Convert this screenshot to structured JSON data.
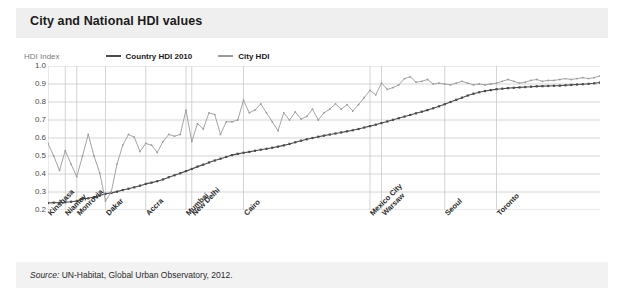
{
  "figure": {
    "title": "City and National HDI values",
    "source": "Source: UN-Habitat, Global Urban Observatory, 2012.",
    "source_prefix": "Source:",
    "source_body": " UN-Habitat, Global Urban Observatory, 2012."
  },
  "colors": {
    "country_line": "#4a4a4a",
    "city_line": "#9a9a9a",
    "grid": "#c9c9c9",
    "header_band": "#efefef",
    "source_band": "#f2f2f2",
    "title_text": "#1a1a1a",
    "axis_text": "#4a4a4a",
    "caption_text": "#7d7d7d"
  },
  "chart_data": {
    "type": "line",
    "title": "City and National HDI values",
    "subtitle": "",
    "xlabel": "",
    "ylabel": "HDI Index",
    "ylim": [
      0.2,
      1.0
    ],
    "yticks": [
      "1.0",
      "0.9",
      "0.8",
      "0.7",
      "0.6",
      "0.5",
      "0.4",
      "0.3",
      "0.2"
    ],
    "ytick_values": [
      1.0,
      0.9,
      0.8,
      0.7,
      0.6,
      0.5,
      0.4,
      0.3,
      0.2
    ],
    "grid": true,
    "grid_horizontal": true,
    "grid_vertical": true,
    "legend_position": "top-left",
    "legend": [
      "Country HDI 2010",
      "City HDI"
    ],
    "axis_caption": "HDI Index",
    "n_points": 97,
    "xtick_labels": [
      "Kinshasa",
      "Niamey",
      "Monrovia",
      "Dakar",
      "Accra",
      "Mumbai",
      "New Delhi",
      "Cairo",
      "Mexico City",
      "Warsaw",
      "Seoul",
      "Toronto"
    ],
    "xtick_indices": [
      0,
      3,
      5,
      10,
      17,
      24,
      25,
      34,
      56,
      58,
      69,
      78
    ],
    "series": [
      {
        "name": "Country HDI 2010",
        "color": "#4a4a4a",
        "marker": "square",
        "values": [
          0.239,
          0.241,
          0.24,
          0.243,
          0.246,
          0.25,
          0.262,
          0.265,
          0.272,
          0.28,
          0.29,
          0.295,
          0.302,
          0.311,
          0.318,
          0.326,
          0.335,
          0.345,
          0.352,
          0.36,
          0.37,
          0.382,
          0.393,
          0.404,
          0.416,
          0.428,
          0.441,
          0.452,
          0.464,
          0.475,
          0.485,
          0.495,
          0.505,
          0.512,
          0.518,
          0.523,
          0.529,
          0.535,
          0.54,
          0.546,
          0.552,
          0.559,
          0.567,
          0.576,
          0.585,
          0.593,
          0.6,
          0.607,
          0.613,
          0.619,
          0.625,
          0.631,
          0.637,
          0.643,
          0.65,
          0.658,
          0.666,
          0.674,
          0.683,
          0.692,
          0.701,
          0.71,
          0.719,
          0.728,
          0.737,
          0.746,
          0.755,
          0.765,
          0.776,
          0.788,
          0.8,
          0.812,
          0.824,
          0.836,
          0.846,
          0.854,
          0.861,
          0.866,
          0.871,
          0.874,
          0.877,
          0.879,
          0.881,
          0.883,
          0.885,
          0.887,
          0.888,
          0.889,
          0.89,
          0.891,
          0.893,
          0.895,
          0.897,
          0.899,
          0.901,
          0.904,
          0.908
        ]
      },
      {
        "name": "City HDI",
        "color": "#9a9a9a",
        "marker": "dot",
        "values": [
          0.57,
          0.5,
          0.42,
          0.53,
          0.455,
          0.385,
          0.5,
          0.62,
          0.5,
          0.405,
          0.25,
          0.3,
          0.455,
          0.56,
          0.62,
          0.605,
          0.525,
          0.57,
          0.56,
          0.52,
          0.58,
          0.62,
          0.61,
          0.62,
          0.755,
          0.58,
          0.68,
          0.65,
          0.74,
          0.73,
          0.62,
          0.69,
          0.69,
          0.7,
          0.81,
          0.74,
          0.755,
          0.79,
          0.74,
          0.69,
          0.64,
          0.74,
          0.7,
          0.745,
          0.705,
          0.72,
          0.76,
          0.7,
          0.74,
          0.76,
          0.79,
          0.76,
          0.785,
          0.75,
          0.785,
          0.825,
          0.865,
          0.84,
          0.905,
          0.87,
          0.88,
          0.895,
          0.93,
          0.94,
          0.91,
          0.915,
          0.925,
          0.9,
          0.905,
          0.9,
          0.895,
          0.905,
          0.915,
          0.905,
          0.895,
          0.9,
          0.895,
          0.9,
          0.905,
          0.915,
          0.925,
          0.915,
          0.905,
          0.91,
          0.92,
          0.925,
          0.915,
          0.92,
          0.92,
          0.925,
          0.93,
          0.925,
          0.93,
          0.935,
          0.93,
          0.935,
          0.945
        ]
      }
    ]
  }
}
